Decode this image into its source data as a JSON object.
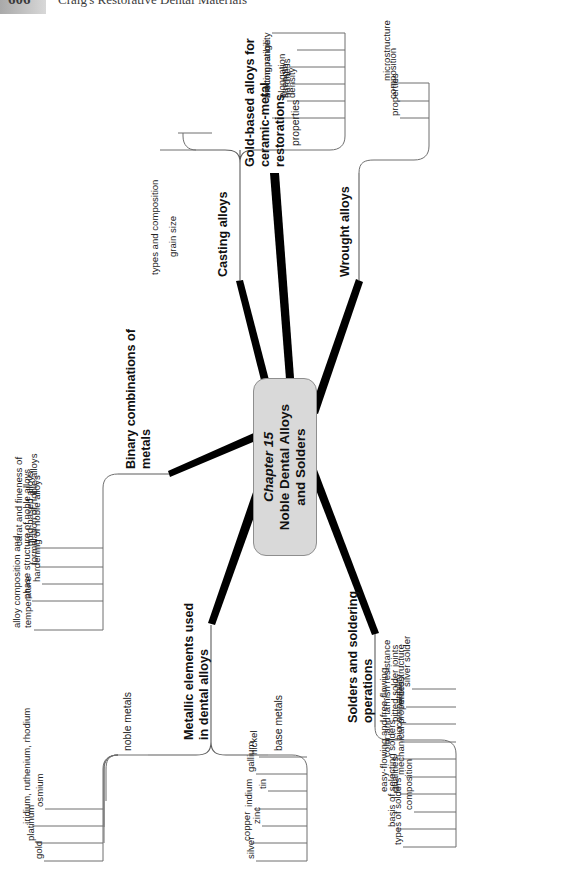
{
  "page": {
    "folio": "606",
    "running_head": "Craig's Restorative Dental Materials"
  },
  "map": {
    "center": {
      "chapter": "Chapter 15",
      "title": "Noble Dental Alloys\nand Solders"
    },
    "branches": [
      {
        "id": "metallic-elements",
        "label": "Metallic elements used\nin dental alloys",
        "children": [
          {
            "id": "noble-metals",
            "label": "noble metals",
            "children": [
              {
                "id": "gold",
                "label": "gold"
              },
              {
                "id": "platinum",
                "label": "platinum"
              },
              {
                "id": "iridium-ruthenium-rhodium",
                "label": "iridium, ruthenium, rhodium"
              },
              {
                "id": "osmium",
                "label": "osmium"
              }
            ]
          },
          {
            "id": "base-metals",
            "label": "base metals",
            "children": [
              {
                "id": "silver",
                "label": "silver"
              },
              {
                "id": "copper",
                "label": "copper"
              },
              {
                "id": "zinc",
                "label": "zinc"
              },
              {
                "id": "indium",
                "label": "indium"
              },
              {
                "id": "tin",
                "label": "tin"
              },
              {
                "id": "gallium",
                "label": "gallium"
              },
              {
                "id": "nickel",
                "label": "nickel"
              }
            ]
          }
        ]
      },
      {
        "id": "binary-combinations",
        "label": "Binary combinations of\nmetals",
        "children": [
          {
            "id": "alloy-composition-temperature",
            "label": "alloy composition and\ntemperature"
          },
          {
            "id": "phase-structure",
            "label": "phase structure of noble alloys"
          },
          {
            "id": "hardening",
            "label": "hardening of noble alloys"
          },
          {
            "id": "formulation",
            "label": "formulation of noble alloys"
          },
          {
            "id": "carat-fineness",
            "label": "carat and fineness of\ngold-based alloys"
          }
        ]
      },
      {
        "id": "casting-alloys",
        "label": "Casting alloys",
        "children": [
          {
            "id": "types-and-composition",
            "label": "types and composition"
          },
          {
            "id": "grain-size",
            "label": "grain size"
          },
          {
            "id": "properties",
            "label": "properties",
            "children": [
              {
                "id": "melting-range",
                "label": "melting range"
              },
              {
                "id": "density",
                "label": "density"
              },
              {
                "id": "strength",
                "label": "strength"
              },
              {
                "id": "hardness",
                "label": "hardness"
              },
              {
                "id": "elongation",
                "label": "elongation"
              },
              {
                "id": "biocompatibility",
                "label": "biocompatibility"
              }
            ]
          }
        ]
      },
      {
        "id": "gold-based-alloys",
        "label": "Gold-based alloys for\nceramic-metal\nrestorations",
        "children": []
      },
      {
        "id": "wrought-alloys",
        "label": "Wrought alloys",
        "children": [
          {
            "id": "microstructure",
            "label": "microstructure"
          },
          {
            "id": "composition",
            "label": "composition"
          },
          {
            "id": "wrought-properties",
            "label": "properties"
          }
        ]
      },
      {
        "id": "solders-and-soldering",
        "label": "Solders and soldering\noperations",
        "children": [
          {
            "id": "types-of-solders",
            "label": "types of solders"
          },
          {
            "id": "basis-of-selecting-solders",
            "label": "basis of selecting solders"
          },
          {
            "id": "solder-composition",
            "label": "composition"
          },
          {
            "id": "easy-free-flowing",
            "label": "easy-flowing and free-flowing\nqualities"
          },
          {
            "id": "mechanical-properties",
            "label": "mechanical properties"
          },
          {
            "id": "color-tarnish-resistance",
            "label": "color and tarnish resistance"
          },
          {
            "id": "solder-biocompatibility",
            "label": "biocompatibility"
          },
          {
            "id": "pitted-solder-joints",
            "label": "pitted solder joints"
          },
          {
            "id": "solder-microstructure",
            "label": "microstructure"
          },
          {
            "id": "silver-solder",
            "label": "silver solder"
          }
        ]
      }
    ]
  }
}
